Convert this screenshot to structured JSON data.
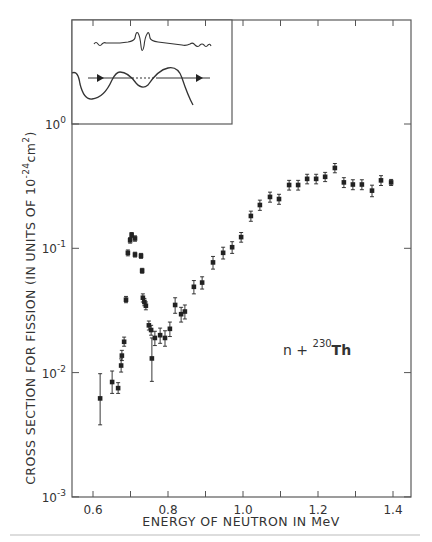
{
  "chart_data": {
    "type": "scatter",
    "title": "",
    "xlabel": "ENERGY OF NEUTRON IN MeV",
    "ylabel": "CROSS SECTION FOR FISSION (IN UNITS OF 10^-24 cm^2)",
    "ylabel_parts": {
      "main": "CROSS SECTION FOR FISSION (IN UNITS OF 10",
      "exp": "-24",
      "unit": "cm",
      "unit_exp": "2",
      "close": ")"
    },
    "xlim": [
      0.545,
      1.45
    ],
    "ylim": [
      0.001,
      1.0
    ],
    "yscale": "log",
    "x_ticks": [
      0.6,
      0.8,
      1.0,
      1.2,
      1.4
    ],
    "x_tick_labels": [
      "0.6",
      "0.8",
      "1.0",
      "1.2",
      "1.4"
    ],
    "y_ticks": [
      1.0,
      0.1,
      0.01,
      0.001
    ],
    "y_tick_labels": [
      {
        "base": "10",
        "exp": "0"
      },
      {
        "base": "10",
        "exp": "-1"
      },
      {
        "base": "10",
        "exp": "-2"
      },
      {
        "base": "10",
        "exp": "-3"
      }
    ],
    "grid": false,
    "annotation": {
      "text": "n + ",
      "isotope_mass": "230",
      "isotope": "Th"
    },
    "inset": {
      "description": "double-humped fission barrier potential with transmitted wave function",
      "arrows": 2
    },
    "series": [
      {
        "name": "n + 230Th fission cross section",
        "points": [
          {
            "x": 0.619,
            "y": 0.0062,
            "err": [
              0.0038,
              0.0098
            ]
          },
          {
            "x": 0.651,
            "y": 0.0084,
            "err": [
              0.0068,
              0.0103
            ]
          },
          {
            "x": 0.667,
            "y": 0.0075,
            "err": [
              0.0068,
              0.0083
            ]
          },
          {
            "x": 0.675,
            "y": 0.0114,
            "err": [
              0.0101,
              0.0129
            ]
          },
          {
            "x": 0.677,
            "y": 0.0137,
            "err": [
              0.0125,
              0.0151
            ]
          },
          {
            "x": 0.683,
            "y": 0.0177,
            "err": [
              0.0163,
              0.0193
            ]
          },
          {
            "x": 0.688,
            "y": 0.0386,
            "err": [
              0.0365,
              0.041
            ]
          },
          {
            "x": 0.693,
            "y": 0.092,
            "err": [
              0.087,
              0.097
            ]
          },
          {
            "x": 0.699,
            "y": 0.116,
            "err": [
              0.11,
              0.122
            ]
          },
          {
            "x": 0.703,
            "y": 0.128,
            "err": [
              0.122,
              0.134
            ]
          },
          {
            "x": 0.712,
            "y": 0.12,
            "err": [
              0.114,
              0.126
            ]
          },
          {
            "x": 0.712,
            "y": 0.089,
            "err": [
              0.085,
              0.093
            ]
          },
          {
            "x": 0.728,
            "y": 0.087,
            "err": [
              0.083,
              0.091
            ]
          },
          {
            "x": 0.731,
            "y": 0.066,
            "err": [
              0.063,
              0.069
            ]
          },
          {
            "x": 0.733,
            "y": 0.04,
            "err": [
              0.037,
              0.043
            ]
          },
          {
            "x": 0.737,
            "y": 0.037,
            "err": [
              0.0345,
              0.0395
            ]
          },
          {
            "x": 0.741,
            "y": 0.0345,
            "err": [
              0.032,
              0.037
            ]
          },
          {
            "x": 0.749,
            "y": 0.024,
            "err": [
              0.022,
              0.026
            ]
          },
          {
            "x": 0.755,
            "y": 0.022,
            "err": [
              0.02,
              0.024
            ]
          },
          {
            "x": 0.757,
            "y": 0.013,
            "err": [
              0.0085,
              0.019
            ]
          },
          {
            "x": 0.765,
            "y": 0.019,
            "err": [
              0.0165,
              0.0215
            ]
          },
          {
            "x": 0.779,
            "y": 0.02,
            "err": [
              0.0172,
              0.0228
            ]
          },
          {
            "x": 0.792,
            "y": 0.019,
            "err": [
              0.0163,
              0.0217
            ]
          },
          {
            "x": 0.805,
            "y": 0.0225,
            "err": [
              0.0195,
              0.0255
            ]
          },
          {
            "x": 0.819,
            "y": 0.035,
            "err": [
              0.03,
              0.04
            ]
          },
          {
            "x": 0.835,
            "y": 0.0295,
            "err": [
              0.0255,
              0.0335
            ]
          },
          {
            "x": 0.845,
            "y": 0.031,
            "err": [
              0.027,
              0.035
            ]
          },
          {
            "x": 0.869,
            "y": 0.049,
            "err": [
              0.043,
              0.055
            ]
          },
          {
            "x": 0.891,
            "y": 0.053,
            "err": [
              0.047,
              0.059
            ]
          },
          {
            "x": 0.92,
            "y": 0.077,
            "err": [
              0.068,
              0.086
            ]
          },
          {
            "x": 0.947,
            "y": 0.092,
            "err": [
              0.082,
              0.102
            ]
          },
          {
            "x": 0.971,
            "y": 0.102,
            "err": [
              0.091,
              0.113
            ]
          },
          {
            "x": 0.995,
            "y": 0.123,
            "err": [
              0.112,
              0.134
            ]
          },
          {
            "x": 1.021,
            "y": 0.182,
            "err": [
              0.165,
              0.199
            ]
          },
          {
            "x": 1.045,
            "y": 0.223,
            "err": [
              0.202,
              0.244
            ]
          },
          {
            "x": 1.072,
            "y": 0.259,
            "err": [
              0.235,
              0.283
            ]
          },
          {
            "x": 1.096,
            "y": 0.249,
            "err": [
              0.226,
              0.272
            ]
          },
          {
            "x": 1.123,
            "y": 0.323,
            "err": [
              0.294,
              0.352
            ]
          },
          {
            "x": 1.147,
            "y": 0.323,
            "err": [
              0.294,
              0.352
            ]
          },
          {
            "x": 1.171,
            "y": 0.362,
            "err": [
              0.33,
              0.394
            ]
          },
          {
            "x": 1.195,
            "y": 0.362,
            "err": [
              0.33,
              0.394
            ]
          },
          {
            "x": 1.219,
            "y": 0.376,
            "err": [
              0.344,
              0.408
            ]
          },
          {
            "x": 1.245,
            "y": 0.443,
            "err": [
              0.405,
              0.481
            ]
          },
          {
            "x": 1.269,
            "y": 0.339,
            "err": [
              0.308,
              0.37
            ]
          },
          {
            "x": 1.293,
            "y": 0.326,
            "err": [
              0.296,
              0.356
            ]
          },
          {
            "x": 1.317,
            "y": 0.326,
            "err": [
              0.296,
              0.356
            ]
          },
          {
            "x": 1.344,
            "y": 0.291,
            "err": [
              0.26,
              0.322
            ]
          },
          {
            "x": 1.368,
            "y": 0.352,
            "err": [
              0.32,
              0.384
            ]
          },
          {
            "x": 1.395,
            "y": 0.339,
            "err": [
              0.32,
              0.358
            ]
          }
        ]
      }
    ],
    "colors": {
      "ink": "#222222",
      "frame": "#555555",
      "background": "#ffffff"
    }
  }
}
